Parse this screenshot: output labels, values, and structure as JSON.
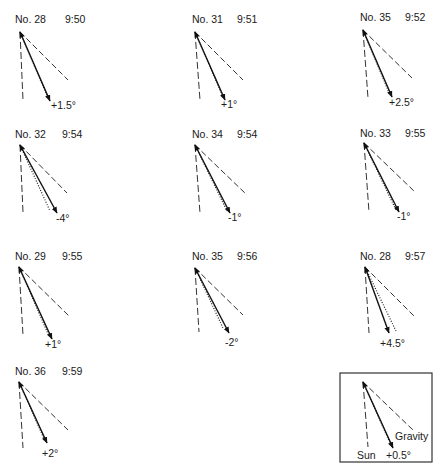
{
  "panels": [
    {
      "number": "No. 28",
      "time": "9:50",
      "deviation": "+1.5°"
    },
    {
      "number": "No. 31",
      "time": "9:51",
      "deviation": "+1°"
    },
    {
      "number": "No. 35",
      "time": "9:52",
      "deviation": "+2.5°"
    },
    {
      "number": "No. 32",
      "time": "9:54",
      "deviation": "-4°"
    },
    {
      "number": "No. 34",
      "time": "9:54",
      "deviation": "-1°"
    },
    {
      "number": "No. 33",
      "time": "9:55",
      "deviation": "-1°"
    },
    {
      "number": "No. 29",
      "time": "9:55",
      "deviation": "+1°"
    },
    {
      "number": "No. 35",
      "time": "9:56",
      "deviation": "-2°"
    },
    {
      "number": "No. 28",
      "time": "9:57",
      "deviation": "+4.5°"
    },
    {
      "number": "No. 36",
      "time": "9:59",
      "deviation": "+2°"
    }
  ],
  "legend": {
    "sun_label": "Sun",
    "gravity_label": "Gravity",
    "deviation": "+0.5°"
  },
  "colors": {
    "ink": "#1a1a1a",
    "background": "#ffffff"
  }
}
